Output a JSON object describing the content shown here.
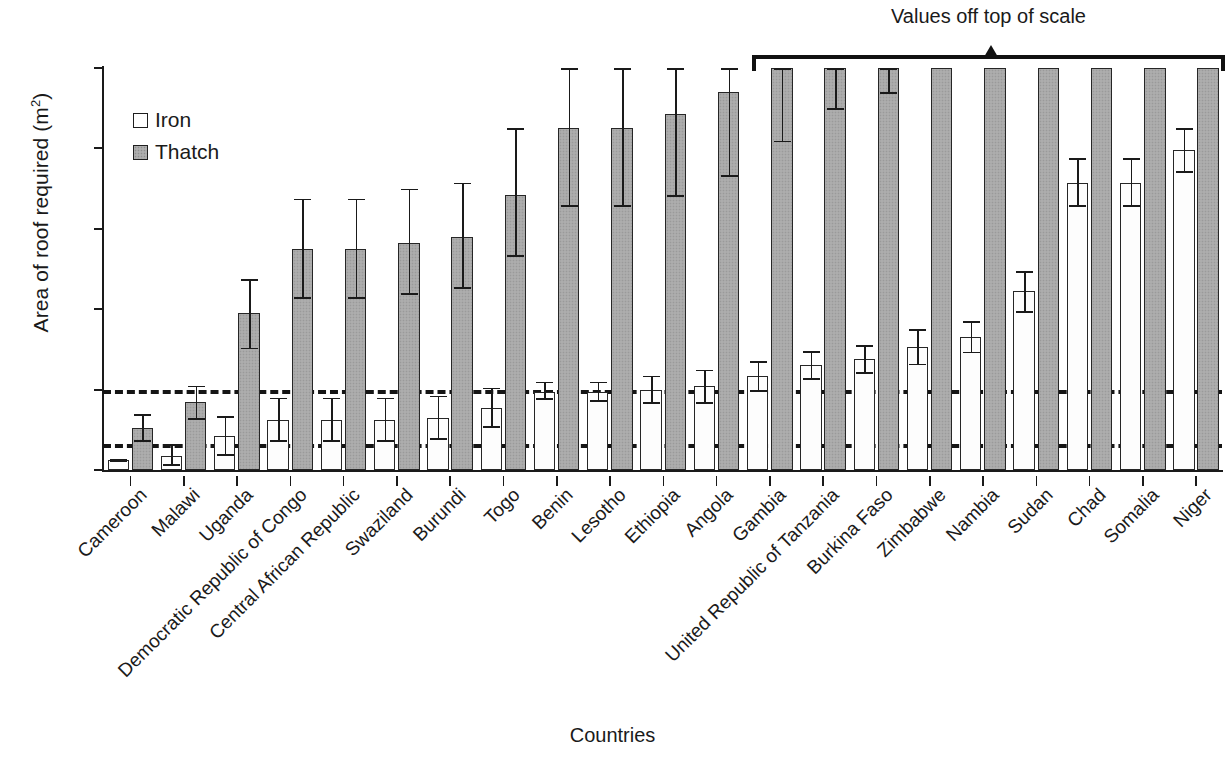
{
  "chart_data": {
    "type": "bar",
    "title": "",
    "xlabel": "Countries",
    "ylabel": "Area of roof required (m²)",
    "ylabel_text": "Area of roof required (m",
    "ylabel_sup": "2",
    "ylabel_close": ")",
    "ylim": [
      0,
      200
    ],
    "yticks": [
      0,
      40,
      80,
      120,
      160,
      200
    ],
    "grid": false,
    "legend_position": "top-left",
    "legend": [
      {
        "name": "Iron",
        "color": "#ffffff"
      },
      {
        "name": "Thatch",
        "color": "#a8a8a8"
      }
    ],
    "annotation": {
      "text": "Values off top of scale",
      "covers_from": "Gambia",
      "covers_to": "Niger"
    },
    "reference_lines": [
      {
        "value": 40,
        "style": "dashed"
      },
      {
        "value": 13,
        "style": "dashed"
      }
    ],
    "categories": [
      "Cameroon",
      "Malawi",
      "Uganda",
      "Democratic Republic of Congo",
      "Central African Republic",
      "Swaziland",
      "Burundi",
      "Togo",
      "Benin",
      "Lesotho",
      "Ethiopia",
      "Angola",
      "Gambia",
      "United Republic of Tanzania",
      "Burkina Faso",
      "Zimbabwe",
      "Nambia",
      "Sudan",
      "Chad",
      "Somalia",
      "Niger"
    ],
    "series": [
      {
        "name": "Iron",
        "values": [
          5,
          7,
          17,
          25,
          25,
          25,
          26,
          31,
          39,
          39,
          40,
          42,
          47,
          52,
          55,
          61,
          66,
          89,
          143,
          143,
          159
        ],
        "err_low": [
          5,
          2,
          7,
          14,
          14,
          14,
          15,
          21,
          35,
          34,
          33,
          33,
          39,
          45,
          48,
          52,
          58,
          78,
          131,
          131,
          148
        ],
        "err_high": [
          5,
          13,
          27,
          36,
          36,
          36,
          37,
          41,
          44,
          44,
          47,
          50,
          54,
          59,
          62,
          70,
          74,
          99,
          155,
          155,
          170
        ],
        "off_scale": [
          false,
          false,
          false,
          false,
          false,
          false,
          false,
          false,
          false,
          false,
          false,
          false,
          false,
          false,
          false,
          false,
          false,
          false,
          false,
          false,
          false
        ]
      },
      {
        "name": "Thatch",
        "values": [
          21,
          34,
          78,
          110,
          110,
          113,
          116,
          137,
          170,
          170,
          177,
          188,
          200,
          200,
          200,
          200,
          200,
          200,
          200,
          200,
          200
        ],
        "err_low": [
          14,
          25,
          60,
          85,
          85,
          87,
          90,
          106,
          131,
          131,
          136,
          146,
          163,
          179,
          187,
          200,
          200,
          200,
          200,
          200,
          200
        ],
        "err_high": [
          28,
          42,
          95,
          135,
          135,
          140,
          143,
          170,
          200,
          200,
          200,
          200,
          200,
          200,
          200,
          200,
          200,
          200,
          200,
          200,
          200
        ],
        "off_scale": [
          false,
          false,
          false,
          false,
          false,
          false,
          false,
          false,
          false,
          false,
          false,
          false,
          true,
          true,
          true,
          true,
          true,
          true,
          true,
          true,
          true
        ]
      }
    ]
  }
}
